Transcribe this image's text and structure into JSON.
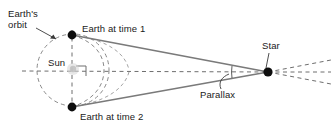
{
  "diagram": {
    "background_color": "#ffffff",
    "labels": {
      "earths_orbit_line1": "Earth's",
      "earths_orbit_line2": "orbit",
      "earth_at_time_1": "Earth at time 1",
      "earth_at_time_2": "Earth at time 2",
      "sun": "Sun",
      "star": "Star",
      "parallax": "Parallax"
    },
    "colors": {
      "text": "#1a1a1a",
      "sight_line": "#7a7a7a",
      "dashed_line": "#6e6e6e",
      "orbit_dash": "#8a8a8a",
      "body_dot": "#0d0d0d",
      "sun_glow": "#c9c9c9",
      "leader": "#3a3a3a"
    },
    "geometry": {
      "orbit_center": [
        73,
        70
      ],
      "orbit_rx": 36,
      "orbit_ry": 36,
      "earth_time_1": [
        72,
        35
      ],
      "earth_time_2": [
        72,
        107
      ],
      "sun": [
        73,
        69
      ],
      "star": [
        268,
        72
      ],
      "parallax_angle_vertex": [
        268,
        72
      ],
      "parallax_arc_at": [
        228,
        72
      ]
    }
  }
}
